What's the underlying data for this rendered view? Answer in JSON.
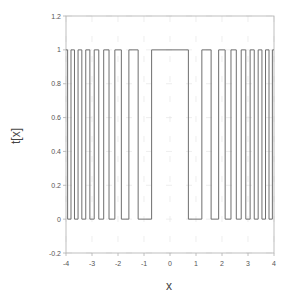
{
  "chart_data": {
    "type": "line",
    "title": "",
    "xlabel": "x",
    "ylabel": "t[x]",
    "xlim": [
      -4,
      4
    ],
    "ylim": [
      -0.2,
      1.2
    ],
    "x_ticks": [
      -4,
      -3,
      -2,
      -1,
      0,
      1,
      2,
      3,
      4
    ],
    "y_ticks": [
      -0.2,
      0,
      0.2,
      0.4,
      0.6,
      0.8,
      1,
      1.2
    ],
    "grid": true,
    "legend": null,
    "high_intervals": [
      [
        -4.0,
        -3.937
      ],
      [
        -3.808,
        -3.674
      ],
      [
        -3.536,
        -3.391
      ],
      [
        -3.24,
        -3.082
      ],
      [
        -2.915,
        -2.739
      ],
      [
        -2.55,
        -2.345
      ],
      [
        -2.121,
        -1.871
      ],
      [
        -1.581,
        -1.225
      ],
      [
        -0.707,
        0.707
      ],
      [
        1.225,
        1.581
      ],
      [
        1.871,
        2.121
      ],
      [
        2.345,
        2.55
      ],
      [
        2.739,
        2.915
      ],
      [
        3.082,
        3.24
      ],
      [
        3.391,
        3.536
      ],
      [
        3.674,
        3.808
      ],
      [
        3.937,
        4.0
      ]
    ],
    "series": [
      {
        "name": "t[x]",
        "color": "#6e6e6e",
        "low": 0,
        "high": 1
      }
    ]
  },
  "labels": {
    "x_axis": "x",
    "y_axis": "t[x]"
  },
  "colors": {
    "line": "#6e6e6e",
    "axis": "#b0b0b0",
    "grid": "#e2e2e2"
  }
}
